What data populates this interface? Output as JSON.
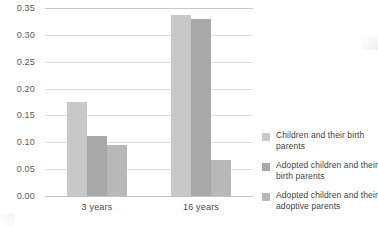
{
  "chart_data": {
    "type": "bar",
    "title": "",
    "xlabel": "",
    "ylabel": "",
    "categories": [
      "3 years",
      "16 years"
    ],
    "series": [
      {
        "name": "Children and their birth parents",
        "values": [
          0.175,
          0.337
        ],
        "color": "#c8c8c8"
      },
      {
        "name": "Adopted children and their birth parents",
        "values": [
          0.112,
          0.33
        ],
        "color": "#a8a8a8"
      },
      {
        "name": "Adopted children and their adoptive parents",
        "values": [
          0.095,
          0.067
        ],
        "color": "#b8b8b8"
      }
    ],
    "ylim": [
      0.0,
      0.35
    ],
    "yticks": [
      "0.00",
      "0.05",
      "0.10",
      "0.15",
      "0.20",
      "0.25",
      "0.30",
      "0.35"
    ],
    "ytick_values": [
      0.0,
      0.05,
      0.1,
      0.15,
      0.2,
      0.25,
      0.3,
      0.35
    ],
    "grid": true,
    "legend_position": "right"
  },
  "legend": {
    "items": [
      {
        "label": "Children and their birth parents"
      },
      {
        "label": "Adopted children and their birth parents"
      },
      {
        "label": "Adopted children and their adoptive parents"
      }
    ]
  },
  "axis": {
    "x_categories": [
      "3 years",
      "16 years"
    ],
    "y_ticks": [
      "0.00",
      "0.05",
      "0.10",
      "0.15",
      "0.20",
      "0.25",
      "0.30",
      "0.35"
    ]
  },
  "colors": {
    "series_1": "#c8c8c8",
    "series_2": "#a8a8a8",
    "series_3": "#b8b8b8",
    "gridline": "#dcdcdc",
    "text": "#4a4a4a",
    "background": "#ffffff"
  }
}
